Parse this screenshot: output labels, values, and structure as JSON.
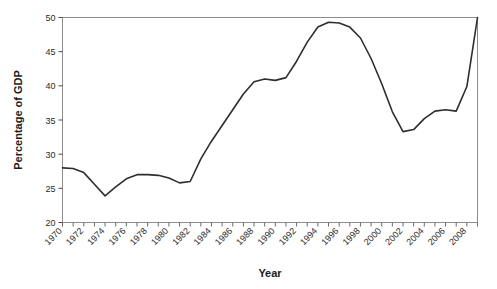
{
  "chart_data": {
    "type": "line",
    "title": "",
    "xlabel": "Year",
    "ylabel": "Percentage of GDP",
    "xlim": [
      1970,
      2009
    ],
    "ylim": [
      20,
      50
    ],
    "grid": false,
    "legend": "none",
    "y_ticks": [
      20,
      25,
      30,
      35,
      40,
      45,
      50
    ],
    "y_tick_labels": [
      "20",
      "25",
      "30",
      "35",
      "40",
      "45",
      "50"
    ],
    "x_tick_labels": [
      "1970",
      "1972",
      "1974",
      "1976",
      "1978",
      "1980",
      "1982",
      "1984",
      "1986",
      "1988",
      "1990",
      "1992",
      "1994",
      "1996",
      "1998",
      "2000",
      "2002",
      "2004",
      "2006",
      "2008"
    ],
    "x_minor_tick_years": [
      1970,
      1971,
      1972,
      1973,
      1974,
      1975,
      1976,
      1977,
      1978,
      1979,
      1980,
      1981,
      1982,
      1983,
      1984,
      1985,
      1986,
      1987,
      1988,
      1989,
      1990,
      1991,
      1992,
      1993,
      1994,
      1995,
      1996,
      1997,
      1998,
      1999,
      2000,
      2001,
      2002,
      2003,
      2004,
      2005,
      2006,
      2007,
      2008,
      2009
    ],
    "series": [
      {
        "name": "Percentage of GDP",
        "color": "#2e2e2e",
        "x": [
          1970,
          1971,
          1972,
          1973,
          1974,
          1975,
          1976,
          1977,
          1978,
          1979,
          1980,
          1981,
          1982,
          1983,
          1984,
          1985,
          1986,
          1987,
          1988,
          1989,
          1990,
          1991,
          1992,
          1993,
          1994,
          1995,
          1996,
          1997,
          1998,
          1999,
          2000,
          2001,
          2002,
          2003,
          2004,
          2005,
          2006,
          2007,
          2008,
          2009
        ],
        "values": [
          28.0,
          27.9,
          27.3,
          25.6,
          23.9,
          25.2,
          26.4,
          27.0,
          27.0,
          26.9,
          26.5,
          25.8,
          26.0,
          29.3,
          31.9,
          34.2,
          36.5,
          38.8,
          40.6,
          41.0,
          40.8,
          41.2,
          43.6,
          46.4,
          48.6,
          49.3,
          49.2,
          48.6,
          47.0,
          44.0,
          40.3,
          36.2,
          33.3,
          33.6,
          35.2,
          36.3,
          36.5,
          36.3,
          39.9,
          50.0
        ]
      }
    ]
  },
  "axes": {
    "y_title": "Percentage of GDP",
    "x_title": "Year"
  }
}
